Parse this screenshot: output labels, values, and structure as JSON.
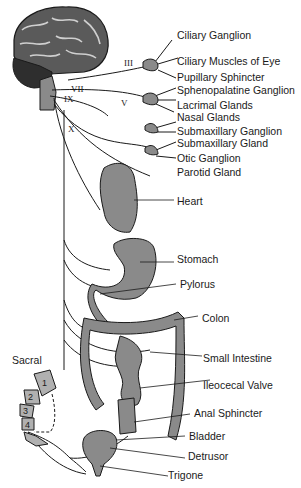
{
  "colors": {
    "organ_fill": "#8a8a8a",
    "brain_fill": "#5a5a5a",
    "line": "#1a1a1a",
    "background": "#ffffff"
  },
  "cranial_nerves": [
    {
      "id": "III",
      "label": "III"
    },
    {
      "id": "VII",
      "label": "VII"
    },
    {
      "id": "IX",
      "label": "IX"
    },
    {
      "id": "V",
      "label": "V"
    },
    {
      "id": "X",
      "label": "X"
    }
  ],
  "labels": {
    "ciliary_ganglion": "Ciliary Ganglion",
    "ciliary_muscles": "Ciliary Muscles of Eye",
    "pupillary_sphincter": "Pupillary Sphincter",
    "sphenopalatine_ganglion": "Sphenopalatine Ganglion",
    "lacrimal_glands": "Lacrimal Glands",
    "nasal_glands": "Nasal Glands",
    "submaxillary_ganglion": "Submaxillary Ganglion",
    "submaxillary_gland": "Submaxillary Gland",
    "otic_ganglion": "Otic Ganglion",
    "parotid_gland": "Parotid Gland",
    "heart": "Heart",
    "stomach": "Stomach",
    "pylorus": "Pylorus",
    "colon": "Colon",
    "small_intestine": "Small Intestine",
    "ileocecal_valve": "Ileocecal Valve",
    "anal_sphincter": "Anal Sphincter",
    "bladder": "Bladder",
    "detrusor": "Detrusor",
    "trigone": "Trigone",
    "sacral": "Sacral"
  },
  "sacral_segments": [
    "1",
    "2",
    "3",
    "4"
  ]
}
